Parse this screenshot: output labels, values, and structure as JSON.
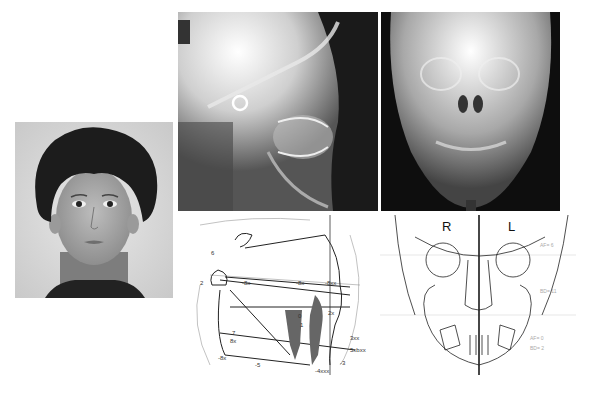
{
  "figure": {
    "panels": [
      {
        "id": "facial-photo",
        "kind": "frontal facial photograph of child"
      },
      {
        "id": "lateral-cephalogram",
        "kind": "lateral cephalometric radiograph"
      },
      {
        "id": "pa-cephalogram",
        "kind": "posteroanterior cephalometric radiograph"
      },
      {
        "id": "lateral-tracing",
        "kind": "lateral cephalometric tracing"
      },
      {
        "id": "frontal-tracing",
        "kind": "frontal cephalometric tracing"
      }
    ]
  },
  "lateral_tracing": {
    "labels": [
      "6",
      "2",
      "-8x",
      "-8x",
      "-8xx",
      "2x",
      "0",
      "1",
      "7",
      "8x",
      "3xx",
      "5xbxx",
      "-8x",
      "-5",
      "-3",
      "-4xxx"
    ]
  },
  "frontal_tracing": {
    "side_right": "R",
    "side_left": "L",
    "faint_labels": [
      "AF= 6",
      "BD= 11",
      "AF= 0",
      "BD= 2"
    ]
  }
}
